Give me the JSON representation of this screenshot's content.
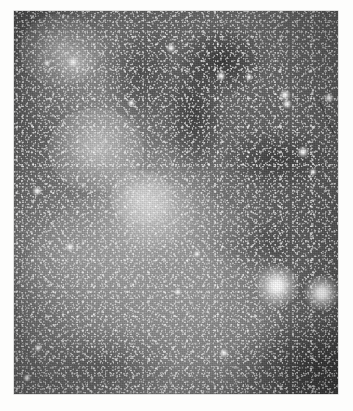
{
  "page": {
    "background_color": "#fdfdfc",
    "kind": "astronomical-photographic-plate"
  },
  "plate": {
    "title": "Milky Way star field with nebulosity and dark dust lanes",
    "frame": {
      "left": 14,
      "top": 11,
      "width": 324,
      "height": 383
    },
    "palette": {
      "sky_dark": "#3c3c3c",
      "sky_mid": "#626262",
      "sky_bright": "#8e8e8e",
      "star_white": "#ffffff",
      "dust_dark": "#141414",
      "margin_white": "#fdfdfc"
    },
    "features": [
      {
        "name": "open-star-cluster-upper-left",
        "x": 60,
        "y": 50,
        "r": 34,
        "brightness": 0.55
      },
      {
        "name": "cluster-knot-upper-left",
        "x": 74,
        "y": 63,
        "r": 16,
        "brightness": 0.7
      },
      {
        "name": "nebular-knot-center",
        "x": 141,
        "y": 197,
        "r": 26,
        "brightness": 0.6
      },
      {
        "name": "nebular-haze-mid-left",
        "x": 96,
        "y": 150,
        "r": 40,
        "brightness": 0.35
      },
      {
        "name": "milky-way-band-lower",
        "x": 150,
        "y": 300,
        "r": 110,
        "brightness": 0.25
      }
    ],
    "bright_stars": [
      {
        "name": "bright-star-lower-right-primary",
        "x": 277,
        "y": 286,
        "size": 22,
        "magnitude": "very bright"
      },
      {
        "name": "bright-star-lower-right-secondary",
        "x": 322,
        "y": 293,
        "size": 18,
        "magnitude": "very bright"
      },
      {
        "name": "star-upper-right-a",
        "x": 285,
        "y": 95,
        "size": 6,
        "magnitude": "bright"
      },
      {
        "name": "star-upper-right-b",
        "x": 287,
        "y": 104,
        "size": 5,
        "magnitude": "bright"
      },
      {
        "name": "star-right-edge",
        "x": 329,
        "y": 98,
        "size": 5,
        "magnitude": "bright"
      },
      {
        "name": "star-right-mid",
        "x": 303,
        "y": 152,
        "size": 6,
        "magnitude": "bright"
      },
      {
        "name": "star-right-lower",
        "x": 313,
        "y": 172,
        "size": 4,
        "magnitude": "moderate"
      },
      {
        "name": "star-top-center",
        "x": 171,
        "y": 48,
        "size": 5,
        "magnitude": "bright"
      },
      {
        "name": "star-top-right",
        "x": 221,
        "y": 76,
        "size": 5,
        "magnitude": "bright"
      },
      {
        "name": "star-top-far-right",
        "x": 249,
        "y": 77,
        "size": 4,
        "magnitude": "moderate"
      },
      {
        "name": "star-cluster-core",
        "x": 73,
        "y": 62,
        "size": 6,
        "magnitude": "bright"
      },
      {
        "name": "star-cluster-west",
        "x": 47,
        "y": 63,
        "size": 4,
        "magnitude": "moderate"
      },
      {
        "name": "star-left-mid",
        "x": 37,
        "y": 191,
        "size": 5,
        "magnitude": "bright"
      },
      {
        "name": "star-left-lower",
        "x": 70,
        "y": 247,
        "size": 5,
        "magnitude": "bright"
      },
      {
        "name": "star-center-lower",
        "x": 178,
        "y": 292,
        "size": 4,
        "magnitude": "moderate"
      },
      {
        "name": "star-bottom-center",
        "x": 224,
        "y": 353,
        "size": 5,
        "magnitude": "bright"
      },
      {
        "name": "star-bottom-left",
        "x": 38,
        "y": 348,
        "size": 4,
        "magnitude": "moderate"
      },
      {
        "name": "star-bottom-far-left",
        "x": 27,
        "y": 378,
        "size": 4,
        "magnitude": "moderate"
      },
      {
        "name": "star-mid-right-faint",
        "x": 197,
        "y": 254,
        "size": 4,
        "magnitude": "moderate"
      },
      {
        "name": "star-upper-mid",
        "x": 131,
        "y": 103,
        "size": 4,
        "magnitude": "moderate"
      }
    ],
    "artifacts": [
      {
        "name": "emulsion-scratch-upper-right",
        "x1": 318,
        "y1": 100,
        "x2": 336,
        "y2": 140
      }
    ]
  }
}
